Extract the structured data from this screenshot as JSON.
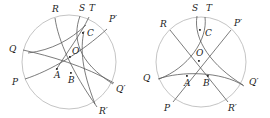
{
  "figure": {
    "caption": "",
    "stroke_color": "#555555",
    "circle_color": "#b8b8b8",
    "label_color": "#222222",
    "background": "#ffffff",
    "width": 270,
    "height": 118
  },
  "panels": [
    {
      "name": "left-panel",
      "circle": {
        "cx": 69,
        "cy": 62,
        "r": 47
      },
      "labels": [
        {
          "id": "R",
          "text": "R",
          "x": 52,
          "y": 12
        },
        {
          "id": "S",
          "text": "S",
          "x": 80,
          "y": 11
        },
        {
          "id": "T",
          "text": "T",
          "x": 90,
          "y": 11
        },
        {
          "id": "Pp",
          "text": "P′",
          "x": 110,
          "y": 21
        },
        {
          "id": "C",
          "text": "C",
          "x": 88,
          "y": 33
        },
        {
          "id": "Q",
          "text": "Q",
          "x": 10,
          "y": 49
        },
        {
          "id": "O",
          "text": "O",
          "x": 73,
          "y": 53
        },
        {
          "id": "A",
          "text": "A",
          "x": 59,
          "y": 76
        },
        {
          "id": "B",
          "text": "B",
          "x": 73,
          "y": 80
        },
        {
          "id": "P",
          "text": "P",
          "x": 13,
          "y": 82
        },
        {
          "id": "Qp",
          "text": "Q′",
          "x": 117,
          "y": 90
        },
        {
          "id": "Rp",
          "text": "R′",
          "x": 100,
          "y": 112
        }
      ],
      "points": [
        {
          "id": "C",
          "x": 83,
          "y": 33
        },
        {
          "id": "O",
          "x": 70,
          "y": 57
        },
        {
          "id": "A",
          "x": 57,
          "y": 69
        },
        {
          "id": "B",
          "x": 71,
          "y": 73
        }
      ]
    },
    {
      "name": "right-panel",
      "circle": {
        "cx": 201,
        "cy": 62,
        "r": 45
      },
      "labels": [
        {
          "id": "S",
          "text": "S",
          "x": 193,
          "y": 11
        },
        {
          "id": "T",
          "text": "T",
          "x": 207,
          "y": 11
        },
        {
          "id": "R",
          "text": "R",
          "x": 161,
          "y": 24
        },
        {
          "id": "Pp",
          "text": "P′",
          "x": 236,
          "y": 23
        },
        {
          "id": "C",
          "text": "C",
          "x": 206,
          "y": 33
        },
        {
          "id": "O",
          "text": "O",
          "x": 198,
          "y": 53
        },
        {
          "id": "Q",
          "text": "Q",
          "x": 145,
          "y": 78
        },
        {
          "id": "A",
          "text": "A",
          "x": 189,
          "y": 84
        },
        {
          "id": "B",
          "text": "B",
          "x": 204,
          "y": 84
        },
        {
          "id": "Qp",
          "text": "Q′",
          "x": 251,
          "y": 82
        },
        {
          "id": "P",
          "text": "P",
          "x": 163,
          "y": 108
        },
        {
          "id": "Rp",
          "text": "R′",
          "x": 229,
          "y": 108
        }
      ],
      "points": [
        {
          "id": "C",
          "x": 200,
          "y": 30
        },
        {
          "id": "O",
          "x": 199,
          "y": 61
        },
        {
          "id": "A",
          "x": 187,
          "y": 76
        },
        {
          "id": "B",
          "x": 208,
          "y": 76
        }
      ]
    }
  ]
}
